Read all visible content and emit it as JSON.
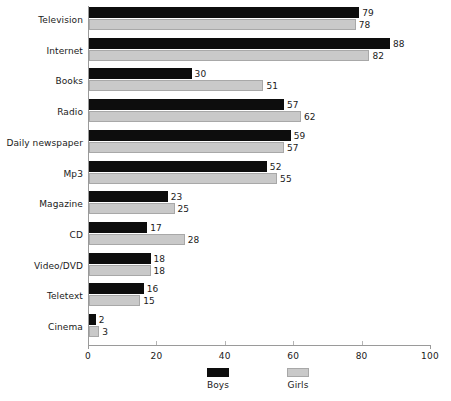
{
  "chart_data": {
    "type": "bar",
    "orientation": "horizontal",
    "title": "",
    "xlabel": "",
    "ylabel": "",
    "xlim": [
      0,
      100
    ],
    "xticks": [
      0,
      20,
      40,
      60,
      80,
      100
    ],
    "xtick_labels": [
      "0",
      "20",
      "40",
      "60",
      "80",
      "100"
    ],
    "grid": false,
    "legend_position": "bottom",
    "categories": [
      "Television",
      "Internet",
      "Books",
      "Radio",
      "Daily newspaper",
      "Mp3",
      "Magazine",
      "CD",
      "Video/DVD",
      "Teletext",
      "Cinema"
    ],
    "series": [
      {
        "name": "Boys",
        "color": "#0d0d0d",
        "values": [
          79,
          88,
          30,
          57,
          59,
          52,
          23,
          17,
          18,
          16,
          2
        ],
        "value_labels": [
          "79",
          "88",
          "30",
          "57",
          "59",
          "52",
          "23",
          "17",
          "18",
          "16",
          "2"
        ]
      },
      {
        "name": "Girls",
        "color": "#c9c9c9",
        "values": [
          78,
          82,
          51,
          62,
          57,
          55,
          25,
          28,
          18,
          15,
          3
        ],
        "value_labels": [
          "78",
          "82",
          "51",
          "62",
          "57",
          "55",
          "25",
          "28",
          "18",
          "15",
          "3"
        ]
      }
    ]
  },
  "legend": {
    "items": [
      {
        "label": "Boys",
        "swatch": "boys"
      },
      {
        "label": "Girls",
        "swatch": "girls"
      }
    ]
  }
}
